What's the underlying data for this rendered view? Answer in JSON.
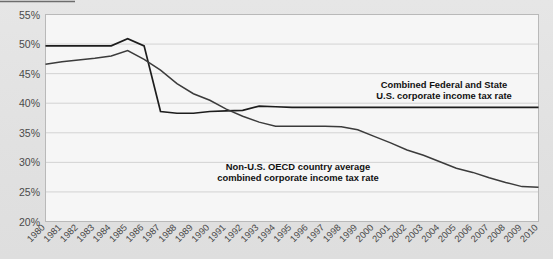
{
  "chart_data": {
    "type": "line",
    "title": "",
    "xlabel": "",
    "ylabel": "",
    "ylim": [
      20,
      55
    ],
    "ytick_labels": [
      "20%",
      "25%",
      "30%",
      "35%",
      "40%",
      "45%",
      "50%",
      "55%"
    ],
    "ytick_values": [
      20,
      25,
      30,
      35,
      40,
      45,
      50,
      55
    ],
    "grid": true,
    "legend_position": "inline-annotations",
    "x": [
      1980,
      1981,
      1982,
      1983,
      1984,
      1985,
      1986,
      1987,
      1988,
      1989,
      1990,
      1991,
      1992,
      1993,
      1994,
      1995,
      1996,
      1997,
      1998,
      1999,
      2000,
      2001,
      2002,
      2003,
      2004,
      2005,
      2006,
      2007,
      2008,
      2009,
      2010
    ],
    "categories": [
      "1980",
      "1981",
      "1982",
      "1983",
      "1984",
      "1985",
      "1986",
      "1987",
      "1988",
      "1989",
      "1990",
      "1991",
      "1992",
      "1993",
      "1994",
      "1995",
      "1996",
      "1997",
      "1998",
      "1999",
      "2000",
      "2001",
      "2002",
      "2003",
      "2004",
      "2005",
      "2006",
      "2007",
      "2008",
      "2009",
      "2010"
    ],
    "series": [
      {
        "name": "Combined Federal and State U.S. corporate income tax rate",
        "values": [
          49.7,
          49.7,
          49.7,
          49.7,
          49.7,
          50.9,
          49.7,
          38.6,
          38.3,
          38.3,
          38.6,
          38.7,
          38.8,
          39.5,
          39.4,
          39.3,
          39.3,
          39.3,
          39.3,
          39.3,
          39.3,
          39.3,
          39.3,
          39.3,
          39.3,
          39.3,
          39.3,
          39.3,
          39.3,
          39.3,
          39.3
        ]
      },
      {
        "name": "Non-U.S. OECD country average combined corporate income tax rate",
        "values": [
          46.6,
          47.0,
          47.3,
          47.6,
          48.0,
          48.9,
          47.4,
          45.6,
          43.3,
          41.6,
          40.5,
          39.0,
          37.8,
          36.8,
          36.1,
          36.1,
          36.1,
          36.1,
          36.0,
          35.5,
          34.4,
          33.3,
          32.1,
          31.2,
          30.1,
          29.0,
          28.3,
          27.4,
          26.6,
          25.9,
          25.8
        ]
      }
    ],
    "annotations": [
      {
        "name": "us-rate-annotation",
        "lines": [
          "Combined Federal and State",
          "U.S. corporate income tax rate"
        ]
      },
      {
        "name": "oecd-rate-annotation",
        "lines": [
          "Non-U.S. OECD country average",
          "combined corporate income tax rate"
        ]
      }
    ],
    "colors": {
      "us_line": "#1d1d1d",
      "oecd_line": "#3b3b3b",
      "plot_background": "#f6f6f6",
      "canvas_background": "#e3e3e3",
      "gridline": "#c9c9c9",
      "tick_text": "#4a4a4a",
      "annotation_text": "#111111"
    }
  }
}
